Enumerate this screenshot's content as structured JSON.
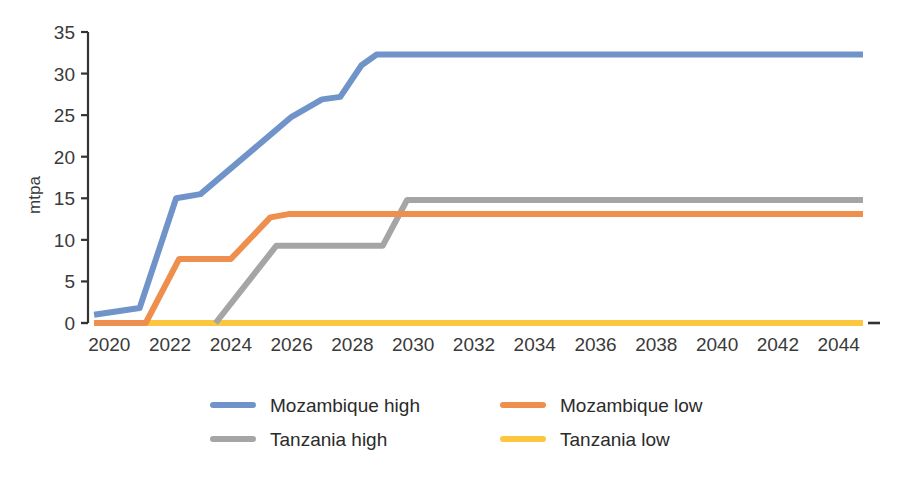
{
  "chart_data": {
    "type": "line",
    "title": "",
    "subtitle": "",
    "xlabel": "",
    "ylabel": "mtpa",
    "xlim": [
      2019.3,
      2044.9
    ],
    "ylim": [
      0,
      35
    ],
    "grid": false,
    "legend_position": "bottom",
    "xticks": [
      2020,
      2022,
      2024,
      2026,
      2028,
      2030,
      2032,
      2034,
      2036,
      2038,
      2040,
      2042,
      2044
    ],
    "xtick_labels": [
      "2020",
      "2022",
      "2024",
      "2026",
      "2028",
      "2030",
      "2032",
      "2034",
      "2036",
      "2038",
      "2040",
      "2042",
      "2044"
    ],
    "yticks": [
      0,
      5,
      10,
      15,
      20,
      25,
      30,
      35
    ],
    "ytick_labels": [
      "0",
      "5",
      "10",
      "15",
      "20",
      "25",
      "30",
      "35"
    ],
    "series": [
      {
        "name": "Mozambique high",
        "color": "#7094c9",
        "x": [
          2019.5,
          2021.0,
          2022.2,
          2023.0,
          2026.0,
          2027.0,
          2027.6,
          2028.3,
          2028.8,
          2044.8
        ],
        "values": [
          1.0,
          1.8,
          15.0,
          15.5,
          24.8,
          26.9,
          27.2,
          31.0,
          32.3,
          32.3
        ]
      },
      {
        "name": "Mozambique low",
        "color": "#ee8f4e",
        "x": [
          2019.5,
          2021.2,
          2022.3,
          2023.3,
          2024.0,
          2025.3,
          2025.9,
          2044.8
        ],
        "values": [
          0.0,
          0.0,
          7.7,
          7.7,
          7.7,
          12.7,
          13.1,
          13.1
        ]
      },
      {
        "name": "Tanzania high",
        "color": "#a5a5a5",
        "x": [
          2023.5,
          2025.5,
          2029.0,
          2029.8,
          2044.8
        ],
        "values": [
          0.0,
          9.3,
          9.3,
          14.8,
          14.8
        ]
      },
      {
        "name": "Tanzania low",
        "color": "#fcc63f",
        "x": [
          2019.5,
          2044.8
        ],
        "values": [
          0.0,
          0.0
        ]
      }
    ]
  },
  "legend": {
    "items": [
      {
        "label": "Mozambique high",
        "color": "#7094c9"
      },
      {
        "label": "Mozambique low",
        "color": "#ee8f4e"
      },
      {
        "label": "Tanzania high",
        "color": "#a5a5a5"
      },
      {
        "label": "Tanzania low",
        "color": "#fcc63f"
      }
    ]
  },
  "axes": {
    "y_title": "mtpa"
  }
}
